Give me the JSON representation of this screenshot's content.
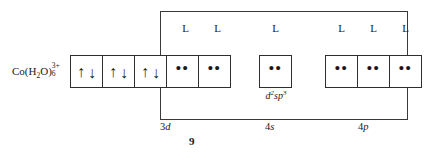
{
  "figure": {
    "number": "9",
    "ion": {
      "element": "Co",
      "open_paren": "(",
      "ligand_formula": "H",
      "ligand_sub": "2",
      "ligand_element": "O",
      "close_paren": ")",
      "charge": "3+",
      "count": "6",
      "full_text": "Co(H2O)6 3+"
    },
    "hybridization": {
      "base": "d",
      "exp1": "2",
      "mid": "sp",
      "exp2": "3",
      "full_text": "d2sp3"
    },
    "subshells": [
      {
        "name": "3d",
        "prefix": "3",
        "letter": "d",
        "box_count": 5
      },
      {
        "name": "4s",
        "prefix": "4",
        "letter": "s",
        "box_count": 1
      },
      {
        "name": "4p",
        "prefix": "4",
        "letter": "p",
        "box_count": 3
      }
    ],
    "ligand_label": "L",
    "ligand_labels": [
      "L",
      "L",
      "L",
      "L",
      "L",
      "L"
    ],
    "boxes_3d": [
      {
        "type": "electron-pair",
        "up": "↑",
        "down": "↓"
      },
      {
        "type": "electron-pair",
        "up": "↑",
        "down": "↓"
      },
      {
        "type": "electron-pair",
        "up": "↑",
        "down": "↓"
      },
      {
        "type": "lone-pair",
        "dots": "••"
      },
      {
        "type": "lone-pair",
        "dots": "••"
      }
    ],
    "boxes_4s": [
      {
        "type": "lone-pair",
        "dots": "••"
      }
    ],
    "boxes_4p": [
      {
        "type": "lone-pair",
        "dots": "••"
      },
      {
        "type": "lone-pair",
        "dots": "••"
      },
      {
        "type": "lone-pair",
        "dots": "••"
      }
    ],
    "colors": {
      "ink": "#1a1a1a",
      "box_stroke": "#2e2e2e",
      "frame_stroke": "#3a3a3a",
      "background": "#ffffff"
    }
  }
}
